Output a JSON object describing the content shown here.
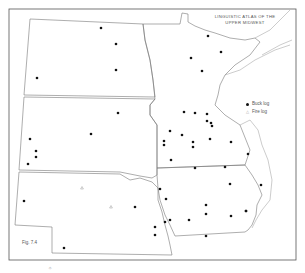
{
  "map": {
    "title_line1": "LINGUISTIC ATLAS OF THE",
    "title_line2": "UPPER MIDWEST",
    "figure_label": "Fig. 7.4",
    "bottom_mark": "✧",
    "colors": {
      "border": "#777777",
      "frame": "#555555",
      "dot": "#111111",
      "triangle": "#999999",
      "water": "#888888"
    },
    "legend": [
      {
        "symbol": "dot",
        "label": "Buck log"
      },
      {
        "symbol": "triangle",
        "label": "Fire log"
      }
    ],
    "states": [
      "North Dakota",
      "South Dakota",
      "Nebraska",
      "Minnesota",
      "Iowa"
    ],
    "buck_log_points": [
      [
        101,
        28
      ],
      [
        116,
        44
      ],
      [
        116,
        70
      ],
      [
        37,
        78
      ],
      [
        208,
        36
      ],
      [
        191,
        58
      ],
      [
        221,
        52
      ],
      [
        202,
        71
      ],
      [
        184,
        112
      ],
      [
        195,
        113
      ],
      [
        207,
        114
      ],
      [
        207,
        121
      ],
      [
        211,
        123
      ],
      [
        212,
        126
      ],
      [
        170,
        131
      ],
      [
        182,
        135
      ],
      [
        164,
        141
      ],
      [
        164,
        145
      ],
      [
        193,
        142
      ],
      [
        193,
        147
      ],
      [
        210,
        139
      ],
      [
        231,
        142
      ],
      [
        171,
        160
      ],
      [
        118,
        113
      ],
      [
        91,
        134
      ],
      [
        30,
        139
      ],
      [
        36,
        151
      ],
      [
        36,
        157
      ],
      [
        28,
        164
      ],
      [
        24,
        201
      ],
      [
        135,
        207
      ],
      [
        155,
        227
      ],
      [
        155,
        235
      ],
      [
        64,
        248
      ],
      [
        195,
        168
      ],
      [
        225,
        167
      ],
      [
        230,
        184
      ],
      [
        160,
        189
      ],
      [
        166,
        199
      ],
      [
        206,
        205
      ],
      [
        206,
        214
      ],
      [
        170,
        220
      ],
      [
        165,
        222
      ],
      [
        189,
        220
      ],
      [
        231,
        216
      ],
      [
        246,
        211
      ],
      [
        206,
        236
      ],
      [
        248,
        154
      ],
      [
        261,
        185
      ],
      [
        246,
        211
      ]
    ],
    "fire_log_points": [
      [
        82,
        188
      ],
      [
        111,
        207
      ]
    ]
  }
}
